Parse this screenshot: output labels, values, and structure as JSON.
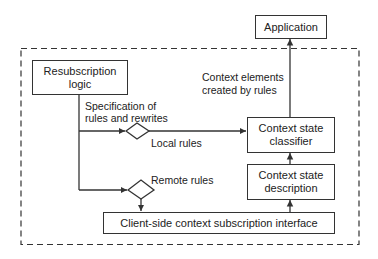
{
  "diagram": {
    "nodes": {
      "application": "Application",
      "resubscription_logic_1": "Resubscription",
      "resubscription_logic_2": "logic",
      "context_state_classifier_1": "Context state",
      "context_state_classifier_2": "classifier",
      "context_state_description_1": "Context state",
      "context_state_description_2": "description",
      "client_interface": "Client-side context subscription interface"
    },
    "edge_labels": {
      "spec_1": "Specification of",
      "spec_2": "rules and rewrites",
      "local_rules": "Local rules",
      "remote_rules": "Remote rules",
      "context_elements_1": "Context elements",
      "context_elements_2": "created by rules"
    },
    "decisions": [
      "local-rules-decision",
      "remote-rules-decision"
    ],
    "boundary": "dashed"
  }
}
